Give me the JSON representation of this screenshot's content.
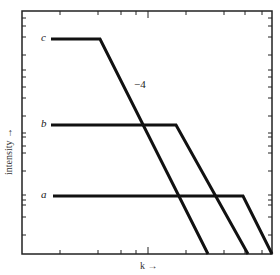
{
  "chart_data": {
    "type": "line",
    "title": "",
    "xlabel": "k →",
    "ylabel": "intensity →",
    "scale": {
      "x": "log",
      "y": "log"
    },
    "grid": false,
    "legend": "inline labels at left end of each curve",
    "annotations": [
      {
        "text": "−4",
        "description": "slope of descending segments"
      }
    ],
    "series": [
      {
        "name": "c",
        "points_px": [
          [
            51,
            39
          ],
          [
            100,
            39
          ],
          [
            208,
            254
          ]
        ],
        "description": "flat at high intensity, then falls with slope −4 starting at low k"
      },
      {
        "name": "b",
        "points_px": [
          [
            51,
            125
          ],
          [
            176,
            125
          ],
          [
            248,
            254
          ]
        ],
        "description": "flat at medium intensity, then falls with slope −4 starting at mid k"
      },
      {
        "name": "a",
        "points_px": [
          [
            53,
            196
          ],
          [
            243,
            196
          ],
          [
            272,
            254
          ]
        ],
        "description": "flat at low intensity, then falls with slope −4 starting at high k"
      }
    ],
    "frame_px": {
      "left": 22,
      "right": 272,
      "top": 11,
      "bottom": 254
    },
    "x_ticks_px": [
      60,
      98,
      121,
      136,
      148,
      186,
      224,
      245,
      262
    ],
    "y_ticks_px_left": [
      18,
      26,
      37,
      55,
      70,
      77,
      87,
      98,
      116,
      133,
      137,
      146,
      153,
      171,
      195,
      200,
      205,
      217,
      235
    ]
  },
  "labels": {
    "c": "c",
    "b": "b",
    "a": "a",
    "slope": "−4",
    "xaxis": "k →",
    "yaxis": "intensity →"
  },
  "colors": {
    "line": "#111111",
    "frame": "#222222",
    "background": "#ffffff"
  }
}
